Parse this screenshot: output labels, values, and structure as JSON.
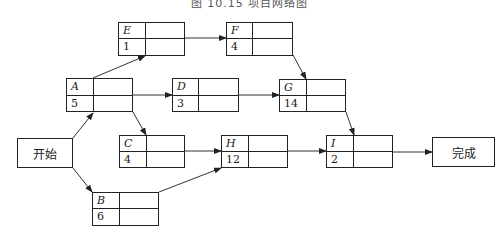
{
  "title": "图 10.15  项目网络图",
  "terminals": {
    "start": {
      "label": "开始"
    },
    "finish": {
      "label": "完成"
    }
  },
  "nodes": [
    {
      "id": "E",
      "name": "E",
      "duration": "1"
    },
    {
      "id": "F",
      "name": "F",
      "duration": "4"
    },
    {
      "id": "A",
      "name": "A",
      "duration": "5"
    },
    {
      "id": "D",
      "name": "D",
      "duration": "3"
    },
    {
      "id": "G",
      "name": "G",
      "duration": "14"
    },
    {
      "id": "C",
      "name": "C",
      "duration": "4"
    },
    {
      "id": "H",
      "name": "H",
      "duration": "12"
    },
    {
      "id": "I",
      "name": "I",
      "duration": "2"
    },
    {
      "id": "B",
      "name": "B",
      "duration": "6"
    }
  ],
  "edges": [
    [
      "start",
      "A"
    ],
    [
      "start",
      "B"
    ],
    [
      "A",
      "E"
    ],
    [
      "A",
      "D"
    ],
    [
      "A",
      "C"
    ],
    [
      "E",
      "F"
    ],
    [
      "F",
      "G"
    ],
    [
      "D",
      "G"
    ],
    [
      "C",
      "H"
    ],
    [
      "B",
      "H"
    ],
    [
      "G",
      "I"
    ],
    [
      "H",
      "I"
    ],
    [
      "I",
      "finish"
    ]
  ]
}
